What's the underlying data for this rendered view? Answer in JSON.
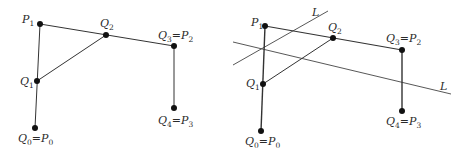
{
  "colors": {
    "stroke": "#333333",
    "point": "#111111",
    "text": "#2a2a2a",
    "background": "#ffffff"
  },
  "left_panel": {
    "points": [
      {
        "id": "P1",
        "x": 40,
        "y": 24,
        "label": "P",
        "sub": "1",
        "lx": 22,
        "ly": 23
      },
      {
        "id": "Q2",
        "x": 106,
        "y": 35,
        "label": "Q",
        "sub": "2",
        "lx": 100,
        "ly": 27
      },
      {
        "id": "Q3",
        "x": 174,
        "y": 46,
        "label": "Q",
        "sub": "3",
        "eq": "=",
        "label2": "P",
        "sub2": "2",
        "lx": 158,
        "ly": 39
      },
      {
        "id": "Q1",
        "x": 37,
        "y": 81,
        "label": "Q",
        "sub": "1",
        "lx": 20,
        "ly": 85
      },
      {
        "id": "Q0",
        "x": 35,
        "y": 128,
        "label": "Q",
        "sub": "0",
        "eq": "=",
        "label2": "P",
        "sub2": "0",
        "lx": 18,
        "ly": 142
      },
      {
        "id": "Q4",
        "x": 174,
        "y": 108,
        "label": "Q",
        "sub": "4",
        "eq": "=",
        "label2": "P",
        "sub2": "3",
        "lx": 158,
        "ly": 124
      }
    ]
  },
  "right_panel": {
    "points": [
      {
        "id": "P1",
        "x": 265,
        "y": 26,
        "label": "P",
        "sub": "1",
        "lx": 251,
        "ly": 26
      },
      {
        "id": "Q2",
        "x": 333,
        "y": 38,
        "label": "Q",
        "sub": "2",
        "lx": 328,
        "ly": 31
      },
      {
        "id": "Q3",
        "x": 402,
        "y": 50,
        "label": "Q",
        "sub": "3",
        "eq": "=",
        "label2": "P",
        "sub2": "2",
        "lx": 386,
        "ly": 42
      },
      {
        "id": "Q1",
        "x": 263,
        "y": 84,
        "label": "Q",
        "sub": "1",
        "lx": 246,
        "ly": 87
      },
      {
        "id": "Q0",
        "x": 261,
        "y": 131,
        "label": "Q",
        "sub": "0",
        "eq": "=",
        "label2": "P",
        "sub2": "0",
        "lx": 245,
        "ly": 145
      },
      {
        "id": "Q4",
        "x": 402,
        "y": 111,
        "label": "Q",
        "sub": "4",
        "eq": "=",
        "label2": "P",
        "sub2": "3",
        "lx": 386,
        "ly": 125
      }
    ],
    "lines": [
      {
        "name": "L",
        "x1": 233,
        "y1": 65,
        "x2": 328,
        "y2": 11,
        "lx": 312,
        "ly": 16
      },
      {
        "name": "L",
        "x1": 233,
        "y1": 42,
        "x2": 451,
        "y2": 94,
        "lx": 440,
        "ly": 90
      }
    ]
  }
}
